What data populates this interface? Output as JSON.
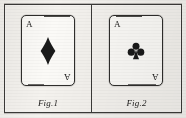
{
  "plate": {
    "background_color": "#f4f2ee",
    "ink_color": "#2f2e2c"
  },
  "figures": [
    {
      "caption": "Fig.1",
      "card": {
        "rank": "A",
        "rank_top_left": "A",
        "rank_bottom_right": "A",
        "suit": "diamonds",
        "suit_icon": "diamond-pip-icon",
        "suit_color": "#1a1a1a",
        "face_color": "#fbfaf7"
      }
    },
    {
      "caption": "Fig.2",
      "card": {
        "rank": "A",
        "rank_top_left": "A",
        "rank_bottom_right": "A",
        "suit": "clubs",
        "suit_icon": "club-pip-icon",
        "suit_color": "#1a1a1a",
        "face_color": "#fbfaf7"
      }
    }
  ]
}
